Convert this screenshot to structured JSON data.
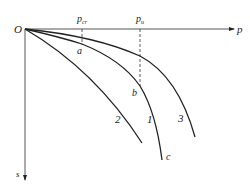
{
  "diagram": {
    "type": "load-settlement curves",
    "colors": {
      "line": "#222222",
      "background": "#ffffff"
    },
    "axes": {
      "origin_label": "O",
      "x_axis_label": "p",
      "y_axis_label": "s"
    },
    "reference_lines": [
      {
        "id": "pcr",
        "label_main": "p",
        "label_sub": "cr",
        "style": "dashed"
      },
      {
        "id": "pu",
        "label_main": "p",
        "label_sub": "u",
        "style": "dashed"
      }
    ],
    "points": [
      {
        "id": "a",
        "label": "a"
      },
      {
        "id": "b",
        "label": "b"
      },
      {
        "id": "c",
        "label": "c"
      }
    ],
    "curves": [
      {
        "id": "curve-1",
        "label": "1"
      },
      {
        "id": "curve-2",
        "label": "2"
      },
      {
        "id": "curve-3",
        "label": "3"
      }
    ]
  }
}
